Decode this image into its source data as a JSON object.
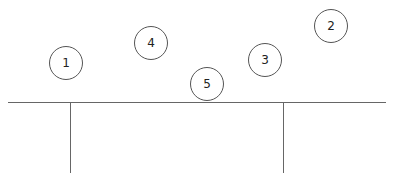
{
  "diagram": {
    "nodes": [
      {
        "label": "1",
        "cx": 66,
        "cy": 63
      },
      {
        "label": "2",
        "cx": 331,
        "cy": 26
      },
      {
        "label": "3",
        "cx": 265,
        "cy": 60
      },
      {
        "label": "4",
        "cx": 151,
        "cy": 43
      },
      {
        "label": "5",
        "cx": 207,
        "cy": 84
      }
    ],
    "beam": {
      "x1": 8,
      "x2": 386,
      "y": 102
    },
    "posts": [
      {
        "x": 70
      },
      {
        "x": 283
      }
    ]
  }
}
